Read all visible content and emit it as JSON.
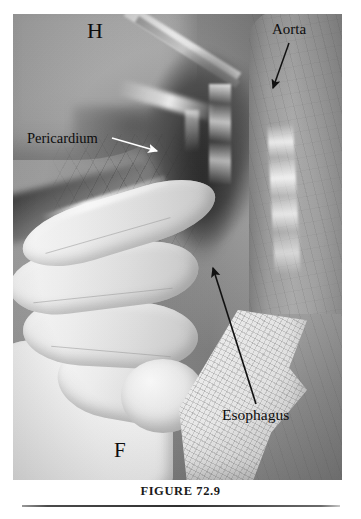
{
  "figure": {
    "caption": "FIGURE 72.9",
    "alt": "Intraoperative photograph of the posterior mediastinum showing the heart, pericardium, aorta and esophagus with a surgeon's gloved hand retracting tissue"
  },
  "annotations": [
    {
      "id": "h",
      "label": "H",
      "meaning": "heart",
      "color": "#0d0d0d",
      "has_arrow": false
    },
    {
      "id": "f",
      "label": "F",
      "meaning": "finger",
      "color": "#0d0d0d",
      "has_arrow": false
    },
    {
      "id": "aorta",
      "label": "Aorta",
      "color": "#0d0d0d",
      "has_arrow": true,
      "arrow_color": "#111111",
      "arrow_from": [
        289,
        43
      ],
      "arrow_to": [
        272,
        90
      ]
    },
    {
      "id": "pericardium",
      "label": "Pericardium",
      "color": "#0d0d0d",
      "has_arrow": true,
      "arrow_color": "#ffffff",
      "arrow_from": [
        112,
        138
      ],
      "arrow_to": [
        160,
        152
      ]
    },
    {
      "id": "esophagus",
      "label": "Esophagus",
      "color": "#0d0d0d",
      "has_arrow": true,
      "arrow_color": "#111111",
      "arrow_from": [
        256,
        404
      ],
      "arrow_to": [
        212,
        265
      ]
    }
  ],
  "photo": {
    "frame": {
      "x": 13,
      "y": 14,
      "width": 329,
      "height": 466
    },
    "palette": {
      "field_mid": "#8e8e8e",
      "tissue_light": "#b7b7b7",
      "cavity_dark": "#303030",
      "glove_white": "#fdfdfd",
      "gauze": "#f1f1f1"
    }
  },
  "rule": {
    "color": "#2f2f2f"
  }
}
